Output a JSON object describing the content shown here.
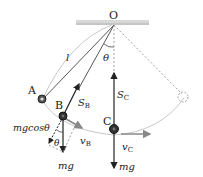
{
  "diagram": {
    "labels": {
      "pivot": "O",
      "length": "l",
      "angle": "θ",
      "angle_small": "θ",
      "pointA": "A",
      "pointB": "B",
      "pointC": "C",
      "tensionB_main": "S",
      "tensionB_sub": "B",
      "tensionC_main": "S",
      "tensionC_sub": "C",
      "component": "mgcosθ",
      "velocityB_main": "v",
      "velocityB_sub": "B",
      "velocityC_main": "v",
      "velocityC_sub": "C",
      "weightB": "mg",
      "weightC": "mg"
    },
    "colors": {
      "line": "#222222",
      "gray": "#888888",
      "ceiling": "#cccccc",
      "arc": "#bbbbbb"
    }
  }
}
